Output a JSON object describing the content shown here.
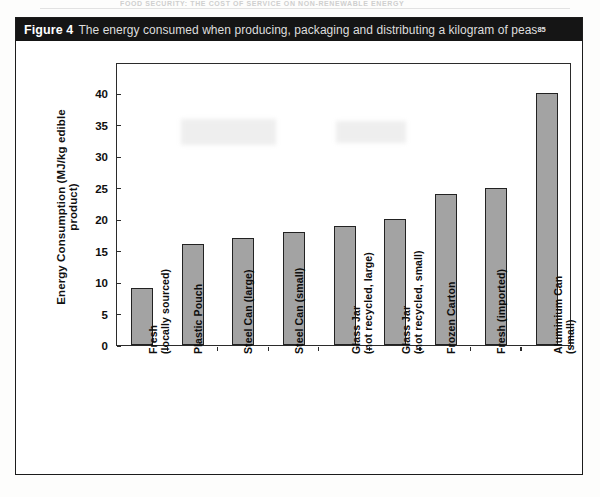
{
  "page": {
    "running_head": "FOOD SECURITY: THE COST OF SERVICE ON NON-RENEWABLE ENERGY"
  },
  "figure": {
    "label": "Figure 4",
    "caption": "The energy consumed when producing, packaging and distributing a kilogram of peas",
    "reference": "85"
  },
  "chart_data": {
    "type": "bar",
    "title": "The energy consumed when producing, packaging and distributing a kilogram of peas",
    "xlabel": "",
    "ylabel": "Energy Consumption (MJ/kg edible product)",
    "ylim": [
      0,
      45
    ],
    "yticks": [
      0,
      5,
      10,
      15,
      20,
      25,
      30,
      35,
      40
    ],
    "grid": false,
    "legend": "none",
    "bar_color": "#a3a3a3",
    "bar_edge_color": "#222222",
    "categories": [
      "Fresh (locally sourced)",
      "Plastic Pouch",
      "Steel Can (large)",
      "Steel Can (small)",
      "Glass Jar (not recycled, large)",
      "Glass Jar (not recycled, small)",
      "Frozen Carton",
      "Fresh (imported)",
      "Aluminium Can (small)"
    ],
    "category_lines": [
      [
        "Fresh",
        "(locally sourced)"
      ],
      [
        "Plastic Pouch",
        ""
      ],
      [
        "Steel Can (large)",
        ""
      ],
      [
        "Steel Can (small)",
        ""
      ],
      [
        "Glass Jar",
        "(not recycled, large)"
      ],
      [
        "Glass Jar",
        "(not recycled, small)"
      ],
      [
        "Frozen Carton",
        ""
      ],
      [
        "Fresh (imported)",
        ""
      ],
      [
        "Aluminium Can",
        "(small)"
      ]
    ],
    "values": [
      9,
      16,
      17,
      18,
      19,
      20,
      24,
      25,
      40
    ]
  }
}
